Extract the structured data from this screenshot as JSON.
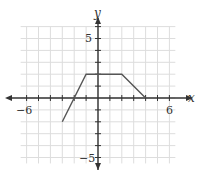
{
  "chart_data": {
    "type": "line",
    "title": "",
    "xlabel": "x",
    "ylabel": "y",
    "xlim": [
      -6.5,
      6.5
    ],
    "ylim": [
      -5.8,
      6
    ],
    "grid": true,
    "x_tick_labels": [
      "-6",
      "6"
    ],
    "y_tick_labels": [
      "5",
      "-5"
    ],
    "series": [
      {
        "name": "f",
        "x": [
          -3,
          -1,
          2,
          4
        ],
        "y": [
          -2,
          2,
          2,
          0
        ]
      }
    ]
  },
  "labels": {
    "x_axis": "x",
    "y_axis": "y",
    "x_neg": "−6",
    "x_pos": "6",
    "y_pos": "5",
    "y_neg": "−5"
  },
  "colors": {
    "line": "#555555",
    "axis": "#333333",
    "grid": "#dddddd"
  }
}
